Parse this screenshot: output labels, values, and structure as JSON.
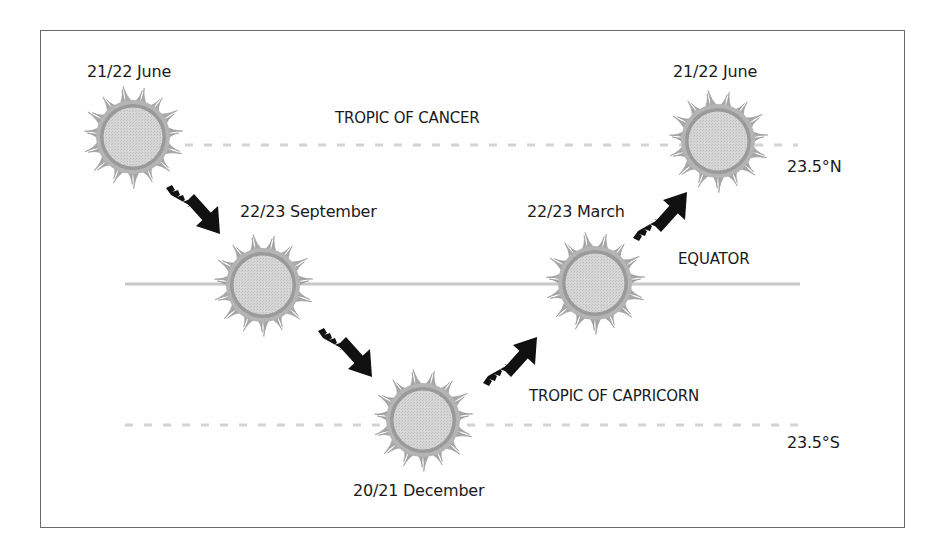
{
  "diagram": {
    "colors": {
      "frame": "#6a6a6a",
      "sun_disk": "#d2d2d2",
      "sun_ring": "#8a8a8a",
      "sun_rays": "#a8a8a8",
      "equator_line": "#c8c8c8",
      "tropic_lines": "#d4d4d4",
      "arrow": "#111111",
      "text": "#1a1a1a"
    },
    "lines": {
      "tropic_of_cancer": {
        "label": "TROPIC OF CANCER",
        "latitude": "23.5°N",
        "style": "dashed"
      },
      "equator": {
        "label": "EQUATOR",
        "style": "solid"
      },
      "tropic_of_capricorn": {
        "label": "TROPIC OF CAPRICORN",
        "latitude": "23.5°S",
        "style": "dashed"
      }
    },
    "suns": [
      {
        "date": "21/22 June",
        "position": "tropic of cancer"
      },
      {
        "date": "22/23 September",
        "position": "equator"
      },
      {
        "date": "20/21 December",
        "position": "tropic of capricorn"
      },
      {
        "date": "22/23 March",
        "position": "equator"
      },
      {
        "date": "21/22 June",
        "position": "tropic of cancer"
      }
    ],
    "arrows": [
      {
        "from": "21/22 June",
        "to": "22/23 September",
        "direction": "down-right"
      },
      {
        "from": "22/23 September",
        "to": "20/21 December",
        "direction": "down-right"
      },
      {
        "from": "20/21 December",
        "to": "22/23 March",
        "direction": "up-right"
      },
      {
        "from": "22/23 March",
        "to": "21/22 June",
        "direction": "up-right"
      }
    ]
  }
}
